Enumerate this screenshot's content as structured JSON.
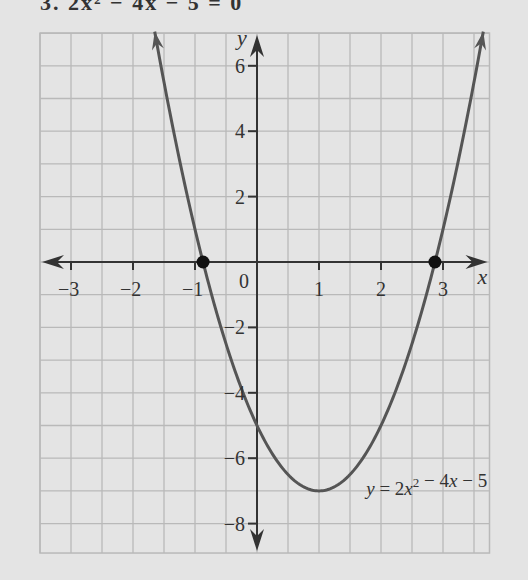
{
  "header": {
    "text": "3. 2x² − 4x − 5 = 0"
  },
  "chart_data": {
    "type": "line",
    "title": "",
    "function": "y = 2x^2 - 4x - 5",
    "xlabel": "x",
    "ylabel": "y",
    "xlim": [
      -3.5,
      3.75
    ],
    "ylim": [
      -8.9,
      7
    ],
    "x_ticks": [
      -3,
      -2,
      -1,
      0,
      1,
      2,
      3
    ],
    "x_tick_labels": [
      "−3",
      "−2",
      "−1",
      "0",
      "1",
      "2",
      "3"
    ],
    "y_ticks": [
      6,
      4,
      2,
      -2,
      -4,
      -6,
      -8
    ],
    "y_tick_labels": [
      "6",
      "4",
      "2",
      "−2",
      "−4",
      "−6",
      "−8"
    ],
    "grid": true,
    "grid_x_step": 0.5,
    "grid_y_step": 1,
    "series": [
      {
        "name": "y = 2x² − 4x − 5",
        "coefficients": {
          "a": 2,
          "b": -4,
          "c": -5
        },
        "x_range": [
          -1.65,
          3.65
        ],
        "color": "#555555"
      }
    ],
    "points": [
      {
        "label": "root-1",
        "x": -0.87,
        "y": 0
      },
      {
        "label": "root-2",
        "x": 2.87,
        "y": 0
      }
    ],
    "vertex": {
      "x": 1,
      "y": -7
    },
    "annotations": [
      {
        "text_parts": [
          "y",
          " = 2",
          "x",
          "2",
          " − 4",
          "x",
          " − 5"
        ],
        "x": 1.6,
        "y": -7
      }
    ],
    "colors": {
      "background": "#e4e4e4",
      "grid": "#b9b9b9",
      "axis": "#333333",
      "curve": "#555555",
      "point": "#111111"
    }
  }
}
